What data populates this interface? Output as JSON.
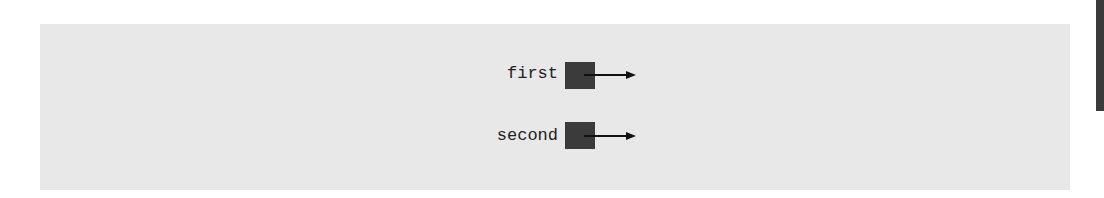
{
  "diagram": {
    "variables": [
      {
        "name": "first",
        "pointer": "arrow-right"
      },
      {
        "name": "second",
        "pointer": "arrow-right"
      }
    ],
    "colors": {
      "panel": "#e8e8e8",
      "box": "#3b3b3b",
      "arrow": "#111111",
      "edge_bar": "#3a3a3a"
    }
  }
}
